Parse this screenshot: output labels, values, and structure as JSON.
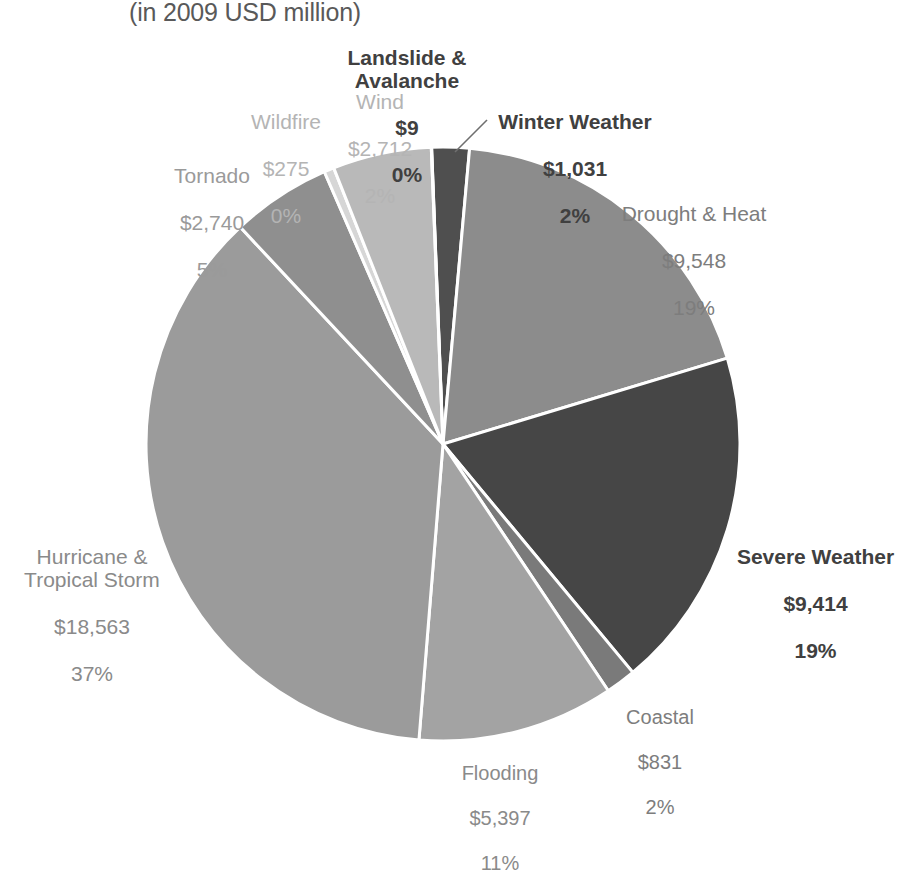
{
  "subtitle": "(in 2009 USD million)",
  "chart_data": {
    "type": "pie",
    "title": "",
    "subtitle": "(in 2009 USD million)",
    "units": "2009 USD million",
    "value_prefix": "$",
    "total": 50520,
    "start_angle_deg": 0,
    "direction": "clockwise",
    "legend": "none",
    "labels_outside": true,
    "categories": [
      "Winter Weather",
      "Drought & Heat",
      "Severe Weather",
      "Coastal",
      "Flooding",
      "Hurricane & Tropical Storm",
      "Tornado",
      "Wildfire",
      "Wind",
      "Landslide & Avalanche"
    ],
    "values": [
      1031,
      9548,
      9414,
      831,
      5397,
      18563,
      2740,
      275,
      2712,
      9
    ],
    "percents": [
      2,
      19,
      19,
      2,
      11,
      37,
      5,
      0,
      2,
      0
    ],
    "colors": [
      "#4f4f4f",
      "#8c8c8c",
      "#464646",
      "#7a7a7a",
      "#a3a3a3",
      "#9b9b9b",
      "#8f8f8f",
      "#d6d6d6",
      "#b9b9b9",
      "#6a6a6a"
    ],
    "slice_border": "#ffffff"
  },
  "slices": {
    "winter_weather": {
      "name": "Winter Weather",
      "value": "$1,031",
      "percent": "2%"
    },
    "drought_heat": {
      "name": "Drought & Heat",
      "value": "$9,548",
      "percent": "19%"
    },
    "severe_weather": {
      "name": "Severe Weather",
      "value": "$9,414",
      "percent": "19%"
    },
    "coastal": {
      "name": "Coastal",
      "value": "$831",
      "percent": "2%"
    },
    "flooding": {
      "name": "Flooding",
      "value": "$5,397",
      "percent": "11%"
    },
    "hurricane_tropical_storm": {
      "name": "Hurricane &\nTropical Storm",
      "value": "$18,563",
      "percent": "37%"
    },
    "tornado": {
      "name": "Tornado",
      "value": "$2,740",
      "percent": "5%"
    },
    "wildfire": {
      "name": "Wildfire",
      "value": "$275",
      "percent": "0%"
    },
    "wind": {
      "name": "Wind",
      "value": "$2,712",
      "percent": "2%"
    },
    "landslide_avalanche": {
      "name": "Landslide &\nAvalanche",
      "value": "$9",
      "percent": "0%"
    }
  }
}
